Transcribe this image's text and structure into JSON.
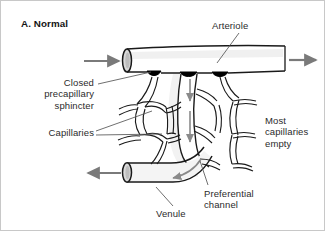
{
  "figure": {
    "panel_title": "A. Normal",
    "background_color": "#ffffff",
    "border_color": "#c8c8c8",
    "width": 325,
    "height": 231
  },
  "labels": {
    "arteriole": "Arteriole",
    "closed_precapillary_sphincter": "Closed\nprecapillary\nsphincter",
    "capillaries": "Capillaries",
    "most_capillaries_empty": "Most\ncapillaries\nempty",
    "preferential_channel": "Preferential\nchannel",
    "venule": "Venule"
  },
  "colors": {
    "vessel_outline": "#1a1a1a",
    "vessel_fill": "#ffffff",
    "vessel_shading": "#e8e8e8",
    "sphincter_node": "#000000",
    "flow_arrow": "#7a7a7a",
    "leader_line": "#555555",
    "text": "#2b2b2b"
  },
  "flow_arrows": {
    "arteriole_inflow": "right",
    "arteriole_outflow": "right",
    "venule_outflow": "left",
    "preferential_channel_flow": "down",
    "venule_curve_flow": "left",
    "count": 5
  },
  "anatomy": {
    "sphincter_count": 3,
    "sphincter_state": "closed",
    "preferential_channel_open": true,
    "capillary_network": "mostly empty"
  }
}
